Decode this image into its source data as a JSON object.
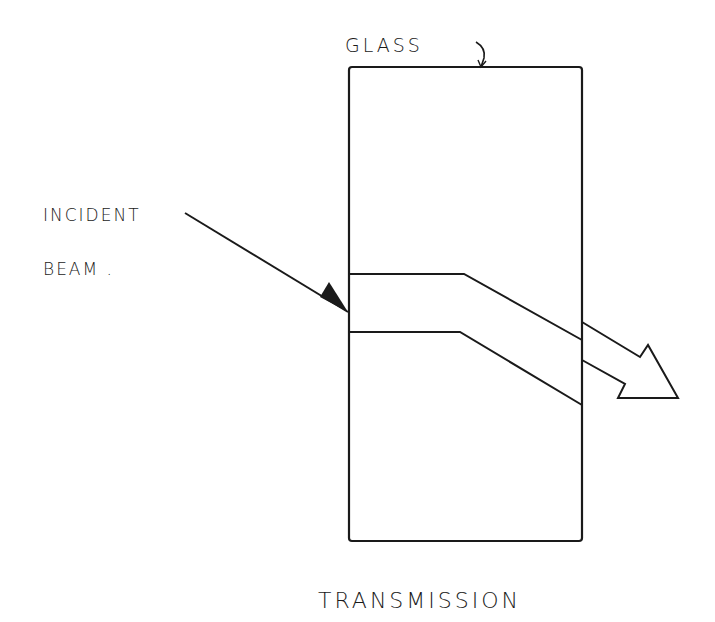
{
  "diagram": {
    "title": "TRANSMISSION",
    "labels": {
      "glass": "GLASS",
      "incident_line1": "INCIDENT",
      "incident_line2": "BEAM ."
    },
    "colors": {
      "ink": "#1a1a1a",
      "background": "#ffffff"
    },
    "elements": [
      {
        "name": "glass-slab",
        "shape": "rectangle"
      },
      {
        "name": "incident-beam-arrow",
        "shape": "line-with-arrowhead"
      },
      {
        "name": "refracted-beam-band",
        "shape": "band"
      },
      {
        "name": "transmitted-beam-arrow",
        "shape": "hollow-arrow"
      }
    ]
  }
}
